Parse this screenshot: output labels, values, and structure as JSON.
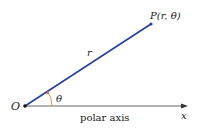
{
  "diagram": {
    "type": "polar-coordinates",
    "origin_label": "O",
    "point_label": "P(r, θ)",
    "radius_label": "r",
    "angle_label": "θ",
    "axis_caption": "polar axis",
    "axis_label": "x",
    "colors": {
      "ray": "#2a3f9a",
      "angle_arc": "#e07040",
      "axis": "#444444",
      "text": "#222222"
    }
  }
}
